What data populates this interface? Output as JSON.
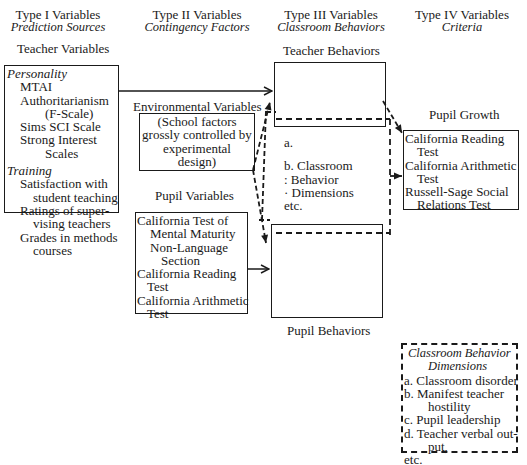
{
  "headers": [
    {
      "title": "Type I Variables",
      "subtitle": "Prediction Sources"
    },
    {
      "title": "Type II Variables",
      "subtitle": "Contingency Factors"
    },
    {
      "title": "Type III Variables",
      "subtitle": "Classroom Behaviors"
    },
    {
      "title": "Type IV Variables",
      "subtitle": "Criteria"
    }
  ],
  "teacher_variables": {
    "label": "Teacher Variables",
    "personality_heading": "Personality",
    "personality_items": [
      "MTAI",
      "Authoritarianism",
      "(F-Scale)",
      "Sims SCI Scale",
      "Strong Interest",
      "Scales"
    ],
    "training_heading": "Training",
    "training_items": [
      "Satisfaction with",
      "student teaching",
      "Ratings of super-",
      "vising teachers",
      "Grades in methods",
      "courses"
    ]
  },
  "environmental_variables": {
    "label": "Environmental Variables",
    "box_lines": [
      "(School factors",
      "grossly controlled by",
      "experimental",
      "design)"
    ]
  },
  "pupil_variables": {
    "label": "Pupil Variables",
    "items": [
      "California Test of",
      "Mental Maturity",
      "Non-Language",
      "Section",
      "California Reading",
      "Test",
      "California  Arithmetic",
      "Test"
    ]
  },
  "classroom_behaviors": {
    "teacher_label": "Teacher Behaviors",
    "pupil_label": "Pupil Behaviors",
    "middle_lines": [
      "a.",
      "b. Classroom",
      ":   Behavior",
      "·   Dimensions",
      "etc."
    ]
  },
  "pupil_growth": {
    "label": "Pupil Growth",
    "items": [
      "California Reading",
      "Test",
      "California  Arithmetic",
      "Test",
      "Russell-Sage Social",
      "Relations Test"
    ]
  },
  "legend": {
    "title_line1": "Classroom Behavior",
    "title_line2": "Dimensions",
    "items": [
      "a.  Classroom disorder",
      "b.  Manifest teacher",
      "hostility",
      "c.  Pupil leadership",
      "d.  Teacher verbal out-",
      "put,",
      "etc."
    ]
  }
}
